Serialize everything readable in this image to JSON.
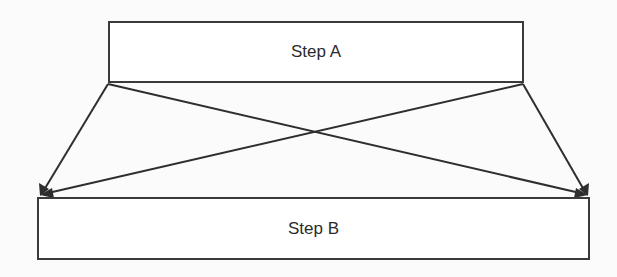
{
  "diagram": {
    "type": "flow",
    "nodes": [
      {
        "id": "A",
        "label": "Step A"
      },
      {
        "id": "B",
        "label": "Step B"
      }
    ],
    "edges": [
      {
        "from": "A",
        "to": "B",
        "from_anchor": "bottom-left",
        "to_anchor": "top-left"
      },
      {
        "from": "A",
        "to": "B",
        "from_anchor": "bottom-left",
        "to_anchor": "top-right"
      },
      {
        "from": "A",
        "to": "B",
        "from_anchor": "bottom-right",
        "to_anchor": "top-left"
      },
      {
        "from": "A",
        "to": "B",
        "from_anchor": "bottom-right",
        "to_anchor": "top-right"
      }
    ],
    "colors": {
      "line": "#2e2e2e",
      "box_border": "#3a3a3a",
      "text": "#2b2b2b",
      "background": "#fbfbfb"
    }
  }
}
